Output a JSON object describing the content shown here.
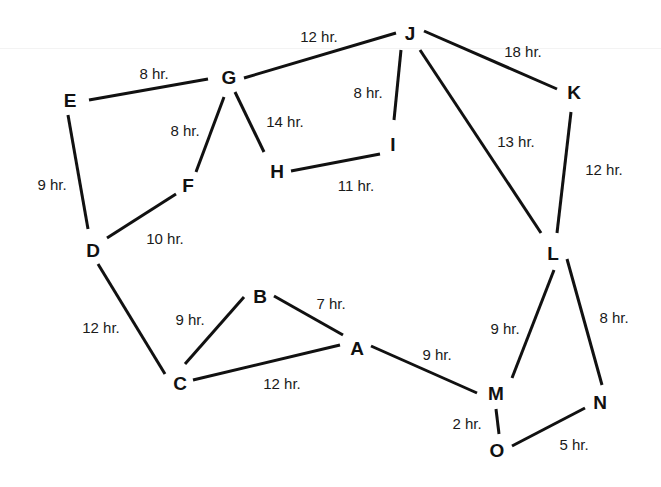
{
  "diagram": {
    "type": "weighted-undirected-graph",
    "colors": {
      "background": "#ffffff",
      "edge": "#111111",
      "text": "#111111"
    },
    "nodes": [
      {
        "id": "A",
        "label": "A",
        "x": 357,
        "y": 348
      },
      {
        "id": "B",
        "label": "B",
        "x": 260,
        "y": 296
      },
      {
        "id": "C",
        "label": "C",
        "x": 180,
        "y": 383
      },
      {
        "id": "D",
        "label": "D",
        "x": 93,
        "y": 250
      },
      {
        "id": "E",
        "label": "E",
        "x": 70,
        "y": 100
      },
      {
        "id": "F",
        "label": "F",
        "x": 188,
        "y": 185
      },
      {
        "id": "G",
        "label": "G",
        "x": 229,
        "y": 77
      },
      {
        "id": "H",
        "label": "H",
        "x": 277,
        "y": 171
      },
      {
        "id": "I",
        "label": "I",
        "x": 393,
        "y": 144
      },
      {
        "id": "J",
        "label": "J",
        "x": 410,
        "y": 33
      },
      {
        "id": "K",
        "label": "K",
        "x": 574,
        "y": 92
      },
      {
        "id": "L",
        "label": "L",
        "x": 553,
        "y": 253
      },
      {
        "id": "M",
        "label": "M",
        "x": 496,
        "y": 393
      },
      {
        "id": "N",
        "label": "N",
        "x": 600,
        "y": 402
      },
      {
        "id": "O",
        "label": "O",
        "x": 497,
        "y": 450
      }
    ],
    "edges": [
      {
        "from": "E",
        "to": "G",
        "label": "8 hr.",
        "x1": 89,
        "y1": 100,
        "x2": 208,
        "y2": 79,
        "lx": 154,
        "ly": 75
      },
      {
        "from": "G",
        "to": "J",
        "label": "12 hr.",
        "x1": 244,
        "y1": 78,
        "x2": 396,
        "y2": 33,
        "lx": 319,
        "ly": 38
      },
      {
        "from": "J",
        "to": "K",
        "label": "18 hr.",
        "x1": 424,
        "y1": 31,
        "x2": 557,
        "y2": 89,
        "lx": 523,
        "ly": 53
      },
      {
        "from": "J",
        "to": "I",
        "label": "8 hr.",
        "x1": 401,
        "y1": 50,
        "x2": 394,
        "y2": 120,
        "lx": 368,
        "ly": 94
      },
      {
        "from": "J",
        "to": "L",
        "label": "13 hr.",
        "x1": 420,
        "y1": 50,
        "x2": 541,
        "y2": 233,
        "lx": 516,
        "ly": 143
      },
      {
        "from": "K",
        "to": "L",
        "label": "12 hr.",
        "x1": 571,
        "y1": 112,
        "x2": 557,
        "y2": 233,
        "lx": 604,
        "ly": 171
      },
      {
        "from": "G",
        "to": "F",
        "label": "8 hr.",
        "x1": 224,
        "y1": 97,
        "x2": 196,
        "y2": 172,
        "lx": 185,
        "ly": 132
      },
      {
        "from": "G",
        "to": "H",
        "label": "14 hr.",
        "x1": 235,
        "y1": 92,
        "x2": 264,
        "y2": 152,
        "lx": 285,
        "ly": 123
      },
      {
        "from": "H",
        "to": "I",
        "label": "11 hr.",
        "x1": 291,
        "y1": 171,
        "x2": 380,
        "y2": 154,
        "lx": 356,
        "ly": 187
      },
      {
        "from": "E",
        "to": "D",
        "label": "9 hr.",
        "x1": 68,
        "y1": 115,
        "x2": 88,
        "y2": 229,
        "lx": 52,
        "ly": 186
      },
      {
        "from": "F",
        "to": "D",
        "label": "10 hr.",
        "x1": 176,
        "y1": 194,
        "x2": 107,
        "y2": 238,
        "lx": 165,
        "ly": 240
      },
      {
        "from": "D",
        "to": "C",
        "label": "12 hr.",
        "x1": 98,
        "y1": 264,
        "x2": 165,
        "y2": 374,
        "lx": 101,
        "ly": 329
      },
      {
        "from": "C",
        "to": "B",
        "label": "9 hr.",
        "x1": 185,
        "y1": 364,
        "x2": 244,
        "y2": 297,
        "lx": 190,
        "ly": 321
      },
      {
        "from": "B",
        "to": "A",
        "label": "7 hr.",
        "x1": 274,
        "y1": 296,
        "x2": 343,
        "y2": 335,
        "lx": 331,
        "ly": 305
      },
      {
        "from": "C",
        "to": "A",
        "label": "12 hr.",
        "x1": 193,
        "y1": 380,
        "x2": 340,
        "y2": 345,
        "lx": 282,
        "ly": 385
      },
      {
        "from": "A",
        "to": "M",
        "label": "9 hr.",
        "x1": 371,
        "y1": 346,
        "x2": 477,
        "y2": 393,
        "lx": 437,
        "ly": 356
      },
      {
        "from": "L",
        "to": "M",
        "label": "9 hr.",
        "x1": 554,
        "y1": 270,
        "x2": 512,
        "y2": 378,
        "lx": 505,
        "ly": 330
      },
      {
        "from": "L",
        "to": "N",
        "label": "8 hr.",
        "x1": 567,
        "y1": 259,
        "x2": 602,
        "y2": 385,
        "lx": 614,
        "ly": 319
      },
      {
        "from": "M",
        "to": "O",
        "label": "2 hr.",
        "x1": 496,
        "y1": 409,
        "x2": 499,
        "y2": 434,
        "lx": 467,
        "ly": 425
      },
      {
        "from": "N",
        "to": "O",
        "label": "5 hr.",
        "x1": 585,
        "y1": 408,
        "x2": 512,
        "y2": 446,
        "lx": 574,
        "ly": 446
      }
    ]
  }
}
